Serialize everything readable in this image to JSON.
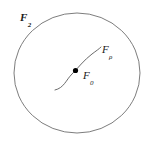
{
  "figure": {
    "caption": "",
    "width": 149,
    "height": 146,
    "background_color": "#ffffff",
    "stroke_color": "#6e6e6e",
    "dot_color": "#000000",
    "text_color": "#1a1a1a"
  },
  "labels": {
    "outer_region": {
      "base": "F",
      "subscript": "2",
      "full": "F2",
      "x": 20,
      "y": 8
    },
    "center_leaf": {
      "base": "F",
      "subscript": "0",
      "full": "F0",
      "x": 83,
      "y": 66
    },
    "rho_leaf": {
      "base": "F",
      "subscript": "ρ",
      "full": "Fρ",
      "x": 102,
      "y": 40
    }
  },
  "shapes": {
    "boundary_ellipse": {
      "name": "outer-ellipse",
      "cx": 77,
      "cy": 73,
      "rx": 63,
      "ry": 60,
      "stroke": "#6e6e6e",
      "stroke_width": 0.9,
      "fill": "none"
    },
    "leaf_curve": {
      "name": "leaf-curve",
      "path": "M 55 90 C 64 88 66 80 72 74 C 78 68 84 60 92 54 C 96 51 99 49 101 47",
      "stroke": "#5a5a5a",
      "stroke_width": 0.9,
      "fill": "none"
    },
    "center_point": {
      "name": "center-dot",
      "cx": 75.5,
      "cy": 70.5,
      "r": 2.6,
      "fill": "#000000"
    }
  }
}
